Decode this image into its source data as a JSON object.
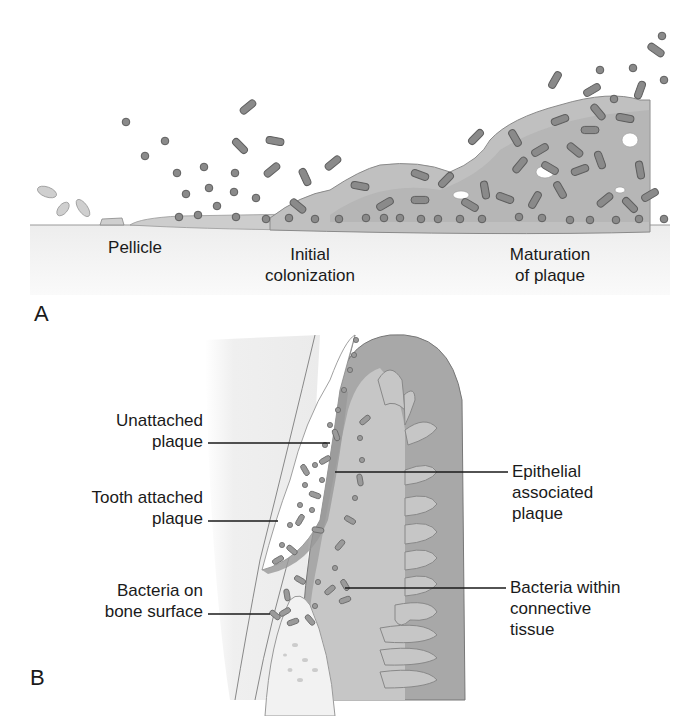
{
  "figure": {
    "panel_a": {
      "letter": "A",
      "stages": [
        {
          "id": "pellicle",
          "lines": [
            "Pellicle"
          ]
        },
        {
          "id": "initial-colonization",
          "lines": [
            "Initial",
            "colonization"
          ]
        },
        {
          "id": "maturation",
          "lines": [
            "Maturation",
            "of plaque"
          ]
        }
      ]
    },
    "panel_b": {
      "letter": "B",
      "left_labels": [
        {
          "id": "unattached-plaque",
          "lines": [
            "Unattached",
            "plaque"
          ]
        },
        {
          "id": "tooth-attached-plaque",
          "lines": [
            "Tooth attached",
            "plaque"
          ]
        },
        {
          "id": "bacteria-bone-surface",
          "lines": [
            "Bacteria on",
            "bone surface"
          ]
        }
      ],
      "right_labels": [
        {
          "id": "epithelial-associated-plaque",
          "lines": [
            "Epithelial",
            "associated",
            "plaque"
          ]
        },
        {
          "id": "bacteria-connective-tissue",
          "lines": [
            "Bacteria within",
            "connective",
            "tissue"
          ]
        }
      ]
    },
    "colors": {
      "bacteria_fill": "#8a8a8a",
      "bacteria_stroke": "#5e5e5e",
      "biofilm": "#c4c4c4",
      "gingiva_dark": "#a6a6a6",
      "gingiva_light": "#c9c9c9",
      "tooth_surface": "#f2f2f2",
      "text": "#1a1a1a"
    }
  }
}
